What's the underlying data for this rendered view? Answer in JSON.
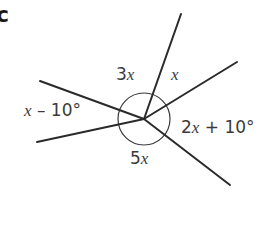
{
  "part_label": "c",
  "diagram": {
    "type": "angles-around-a-point",
    "center": {
      "x": 144,
      "y": 119
    },
    "circle_radius": 26,
    "rays": [
      {
        "name": "ray-top",
        "end": {
          "x": 181,
          "y": 14
        }
      },
      {
        "name": "ray-upper-right",
        "end": {
          "x": 237,
          "y": 62
        }
      },
      {
        "name": "ray-lower-right",
        "end": {
          "x": 230,
          "y": 185
        }
      },
      {
        "name": "ray-lower-left",
        "end": {
          "x": 37,
          "y": 142
        }
      },
      {
        "name": "ray-upper-left",
        "end": {
          "x": 40,
          "y": 81
        }
      }
    ],
    "angles": [
      {
        "name": "angle-3x",
        "coef": "3",
        "var": "x",
        "rest": ""
      },
      {
        "name": "angle-x",
        "coef": "",
        "var": "x",
        "rest": ""
      },
      {
        "name": "angle-2x-plus-10",
        "coef": "2",
        "var": "x",
        "rest": " + 10°"
      },
      {
        "name": "angle-5x",
        "coef": "5",
        "var": "x",
        "rest": ""
      },
      {
        "name": "angle-x-minus-10",
        "coef": "",
        "var": "x",
        "rest": " – 10°"
      }
    ]
  },
  "colors": {
    "line": "#2a2a2a",
    "text": "#3b3b3b",
    "background": "#ffffff"
  }
}
